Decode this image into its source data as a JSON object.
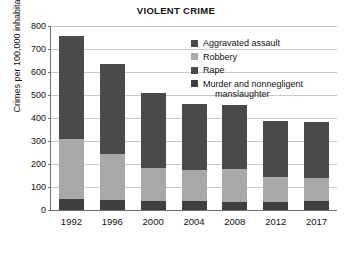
{
  "chart_data": {
    "type": "bar",
    "subtype": "stacked-bar",
    "title": "VIOLENT CRIME",
    "xlabel": "",
    "ylabel": "Crimes per 100,000 inhabitants",
    "categories": [
      "1992",
      "1996",
      "2000",
      "2004",
      "2008",
      "2012",
      "2017"
    ],
    "ylim": [
      0,
      800
    ],
    "yticks": [
      0,
      100,
      200,
      300,
      400,
      500,
      600,
      700,
      800
    ],
    "ytick_labels": [
      "0",
      "100",
      "200",
      "300",
      "400",
      "500",
      "600",
      "700",
      "800"
    ],
    "grid": true,
    "legend_position": "upper right",
    "stack_order_bottom_to_top": [
      "Murder and nonnegligent manslaughter",
      "Rape",
      "Robbery",
      "Aggravated assault"
    ],
    "series": [
      {
        "name": "Murder and nonnegligent manslaughter",
        "color": "#3f3f3f",
        "values": [
          50,
          42,
          38,
          38,
          37,
          34,
          38
        ]
      },
      {
        "name": "Rape",
        "color": "#4a4a4a",
        "values": [
          0,
          0,
          0,
          0,
          0,
          0,
          0
        ]
      },
      {
        "name": "Robbery",
        "color": "#a8a8a8",
        "values": [
          260,
          203,
          144,
          135,
          143,
          111,
          100
        ]
      },
      {
        "name": "Aggravated assault",
        "color": "#4a4a4a",
        "values": [
          448,
          392,
          325,
          290,
          278,
          242,
          245
        ]
      }
    ],
    "totals": [
      758,
      637,
      507,
      463,
      458,
      387,
      383
    ]
  },
  "legend": {
    "items": [
      {
        "label": "Aggravated assault",
        "color": "#4a4a4a"
      },
      {
        "label": "Robbery",
        "color": "#a8a8a8"
      },
      {
        "label": "Rape",
        "color": "#4a4a4a"
      },
      {
        "label": "Murder and nonnegligent",
        "label2": "manslaughter",
        "color": "#3f3f3f"
      }
    ]
  },
  "axis": {
    "y_title": "Crimes per 100,000 inhabitants"
  },
  "colors": {
    "grid": "#c9c9c9",
    "axis": "#6e6e6e",
    "background": "#ffffff",
    "dark_gray": "#4a4a4a",
    "light_gray": "#a8a8a8",
    "darkest_gray": "#3f3f3f"
  }
}
